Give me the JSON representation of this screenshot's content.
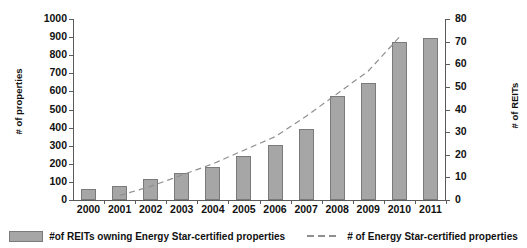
{
  "chart_data": {
    "type": "bar",
    "title": "",
    "xlabel": "",
    "ylabel": "# of properties",
    "ylabel_secondary": "# of REITs",
    "categories": [
      "2000",
      "2001",
      "2002",
      "2003",
      "2004",
      "2005",
      "2006",
      "2007",
      "2008",
      "2009",
      "2010",
      "2011"
    ],
    "ylim": [
      0,
      1000
    ],
    "ytick_step": 100,
    "yticks": [
      "1000",
      "900",
      "800",
      "700",
      "600",
      "500",
      "400",
      "300",
      "200",
      "100",
      "0"
    ],
    "ylim_secondary": [
      0,
      80
    ],
    "ytick_step_secondary": 10,
    "yticks_secondary": [
      "80",
      "70",
      "60",
      "50",
      "40",
      "30",
      "20",
      "10",
      "0"
    ],
    "grid": false,
    "legend_position": "bottom",
    "series": [
      {
        "name": "#of REITs owning Energy Star-certified properties",
        "render": "bar",
        "axis": "left",
        "color": "#a6a6a6",
        "values": [
          60,
          75,
          115,
          150,
          180,
          245,
          305,
          390,
          575,
          645,
          875,
          895
        ]
      },
      {
        "name": "# of Energy Star-certified properties",
        "render": "dashed-line",
        "axis": "right",
        "color": "#8f8f8f",
        "values": [
          null,
          2,
          6,
          11,
          16,
          22,
          28,
          37,
          47,
          57,
          72,
          null
        ]
      }
    ]
  },
  "legend": {
    "items": [
      {
        "label": "#of REITs owning Energy Star-certified properties",
        "marker": "filled-square"
      },
      {
        "label": "# of Energy Star-certified properties",
        "marker": "dashed-line"
      }
    ]
  }
}
